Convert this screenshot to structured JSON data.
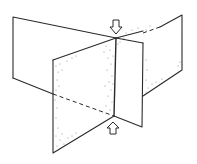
{
  "diagram": {
    "colors": {
      "line": "#2a2a2a",
      "background": "#ffffff",
      "stipple": "#777777"
    },
    "planes": [
      {
        "name": "back-plane",
        "points": [
          [
            13,
            17
          ],
          [
            182,
            15
          ],
          [
            182,
            70
          ],
          [
            143,
            96
          ],
          [
            13,
            78
          ]
        ]
      },
      {
        "name": "front-plane",
        "points": [
          [
            53,
            60
          ],
          [
            116,
            38
          ],
          [
            114,
            116
          ],
          [
            53,
            153
          ]
        ]
      },
      {
        "name": "right-panel",
        "points": [
          [
            116,
            38
          ],
          [
            143,
            43
          ],
          [
            142,
            127
          ],
          [
            114,
            116
          ]
        ]
      }
    ],
    "intersection_line": {
      "top": [
        116,
        38
      ],
      "bottom": [
        114,
        116
      ]
    },
    "arrows": [
      {
        "name": "top-arrow",
        "direction": "down",
        "tip": [
          116,
          34
        ]
      },
      {
        "name": "bottom-arrow",
        "direction": "up",
        "tip": [
          113,
          121
        ]
      }
    ]
  }
}
